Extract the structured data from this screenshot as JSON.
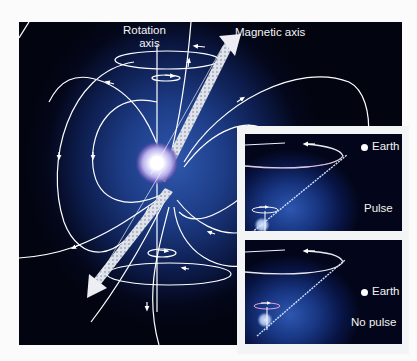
{
  "figure": {
    "main": {
      "labels": {
        "rotation_axis_line1": "Rotation",
        "rotation_axis_line2": "axis",
        "magnetic_axis": "Magnetic axis"
      },
      "elements": [
        "neutron-star",
        "magnetic-field-lines",
        "rotation-axis",
        "magnetic-axis-beam",
        "rotation-ellipses"
      ]
    },
    "insets": [
      {
        "id": "pulse",
        "earth_label": "Earth",
        "state_label": "Pulse"
      },
      {
        "id": "no-pulse",
        "earth_label": "Earth",
        "state_label": "No pulse"
      }
    ],
    "colors": {
      "background": "#fbfbfb",
      "space_dark": "#03061a",
      "space_glow": "#2f58ad",
      "field_lines": "#ffffff",
      "beam": "#e6e8ee",
      "inset_frame": "#f3f4f6"
    }
  }
}
